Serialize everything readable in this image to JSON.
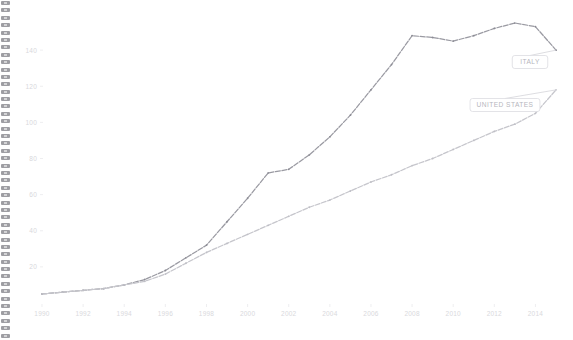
{
  "page": {
    "background_color": "#ffffff",
    "binding": {
      "name": "spiral-binding",
      "ring_count": 46
    }
  },
  "chart_data": {
    "type": "line",
    "title": "",
    "subtitle": "",
    "xlabel": "",
    "ylabel": "",
    "grid": false,
    "legend_position": "inline-callout",
    "x": [
      1990,
      1991,
      1992,
      1993,
      1994,
      1995,
      1996,
      1997,
      1998,
      1999,
      2000,
      2001,
      2002,
      2003,
      2004,
      2005,
      2006,
      2007,
      2008,
      2009,
      2010,
      2011,
      2012,
      2013,
      2014,
      2015
    ],
    "xlim": [
      1990,
      2015
    ],
    "ylim": [
      0,
      160
    ],
    "yticks": [
      20,
      40,
      60,
      80,
      100,
      120,
      140
    ],
    "ytick_labels": [
      "20",
      "40",
      "60",
      "80",
      "100",
      "120",
      "140"
    ],
    "xticks": [
      1990,
      1992,
      1994,
      1996,
      1998,
      2000,
      2002,
      2004,
      2006,
      2008,
      2010,
      2012,
      2014
    ],
    "xtick_labels": [
      "1990",
      "1992",
      "1994",
      "1996",
      "1998",
      "2000",
      "2002",
      "2004",
      "2006",
      "2008",
      "2010",
      "2012",
      "2014"
    ],
    "series": [
      {
        "name": "ITALY",
        "color": "#9a9aa2",
        "values": [
          5,
          6,
          7,
          8,
          10,
          13,
          18,
          25,
          32,
          45,
          58,
          72,
          74,
          82,
          92,
          104,
          118,
          132,
          148,
          147,
          145,
          148,
          152,
          155,
          153,
          140
        ]
      },
      {
        "name": "UNITED STATES",
        "color": "#c6c6cc",
        "values": [
          5,
          6,
          7,
          8,
          10,
          12,
          16,
          22,
          28,
          33,
          38,
          43,
          48,
          53,
          57,
          62,
          67,
          71,
          76,
          80,
          85,
          90,
          95,
          99,
          105,
          118
        ]
      }
    ],
    "annotations": [
      {
        "label": "ITALY",
        "series": "ITALY",
        "box_x": 530,
        "box_y": 62
      },
      {
        "label": "UNITED STATES",
        "series": "UNITED STATES",
        "box_x": 505,
        "box_y": 105
      }
    ]
  }
}
